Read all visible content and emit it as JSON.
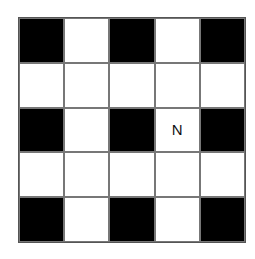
{
  "grid": {
    "rows": 5,
    "cols": 5,
    "colors": {
      "black": "#000000",
      "white": "#ffffff"
    },
    "cells": [
      [
        {
          "fill": "black",
          "label": ""
        },
        {
          "fill": "white",
          "label": ""
        },
        {
          "fill": "black",
          "label": ""
        },
        {
          "fill": "white",
          "label": ""
        },
        {
          "fill": "black",
          "label": ""
        }
      ],
      [
        {
          "fill": "white",
          "label": ""
        },
        {
          "fill": "white",
          "label": ""
        },
        {
          "fill": "white",
          "label": ""
        },
        {
          "fill": "white",
          "label": ""
        },
        {
          "fill": "white",
          "label": ""
        }
      ],
      [
        {
          "fill": "black",
          "label": ""
        },
        {
          "fill": "white",
          "label": ""
        },
        {
          "fill": "black",
          "label": ""
        },
        {
          "fill": "white",
          "label": "N"
        },
        {
          "fill": "black",
          "label": ""
        }
      ],
      [
        {
          "fill": "white",
          "label": ""
        },
        {
          "fill": "white",
          "label": ""
        },
        {
          "fill": "white",
          "label": ""
        },
        {
          "fill": "white",
          "label": ""
        },
        {
          "fill": "white",
          "label": ""
        }
      ],
      [
        {
          "fill": "black",
          "label": ""
        },
        {
          "fill": "white",
          "label": ""
        },
        {
          "fill": "black",
          "label": ""
        },
        {
          "fill": "white",
          "label": ""
        },
        {
          "fill": "black",
          "label": ""
        }
      ]
    ]
  }
}
